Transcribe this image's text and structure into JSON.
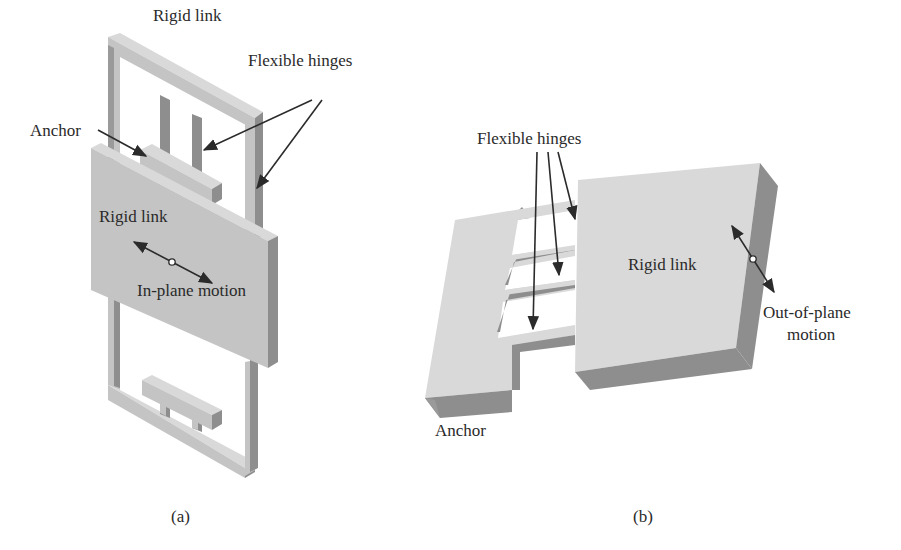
{
  "figure": {
    "panels": [
      {
        "id": "a",
        "caption": "(a)",
        "labels": {
          "rigid_link_top": "Rigid link",
          "flexible_hinges": "Flexible hinges",
          "anchor": "Anchor",
          "rigid_link_plate": "Rigid link",
          "motion": "In-plane motion"
        }
      },
      {
        "id": "b",
        "caption": "(b)",
        "labels": {
          "flexible_hinges": "Flexible hinges",
          "rigid_link": "Rigid link",
          "motion_line1": "Out-of-plane",
          "motion_line2": "motion",
          "anchor": "Anchor"
        }
      }
    ],
    "colors": {
      "face_light": "#d9d9d9",
      "face_mid": "#c4c4c4",
      "face_dark": "#8e8e8e",
      "text": "#2a2a2a"
    }
  }
}
